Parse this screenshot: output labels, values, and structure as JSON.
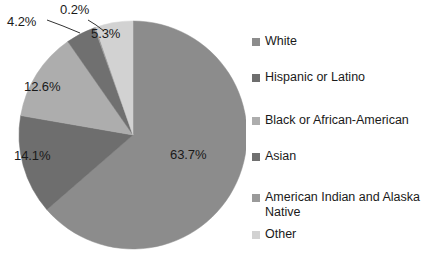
{
  "chart_data": {
    "type": "pie",
    "title": "",
    "subtitle": "",
    "xlabel": "",
    "ylabel": "",
    "legend_position": "right",
    "grid": false,
    "start_angle_deg": 0,
    "direction": "clockwise",
    "categories": [
      "White",
      "Hispanic or Latino",
      "Black or African-American",
      "Asian",
      "American Indian and Alaska Native",
      "Other"
    ],
    "values": [
      63.7,
      14.1,
      12.6,
      4.2,
      0.2,
      5.3
    ],
    "value_labels": [
      "63.7%",
      "14.1%",
      "12.6%",
      "4.2%",
      "0.2%",
      "5.3%"
    ],
    "colors": [
      "#8c8c8c",
      "#6e6e6e",
      "#adadad",
      "#707070",
      "#9a9a9a",
      "#d2d2d2"
    ],
    "units": "percent"
  },
  "pie": {
    "center_x": 133,
    "center_y": 135,
    "radius": 114,
    "slices": [
      {
        "name": "White",
        "value": 63.7,
        "label": "63.7%",
        "color": "#8c8c8c",
        "label_x": 170,
        "label_y": 147,
        "label_inside": true
      },
      {
        "name": "Hispanic or Latino",
        "value": 14.1,
        "label": "14.1%",
        "color": "#6e6e6e",
        "label_x": 14,
        "label_y": 148,
        "label_inside": true
      },
      {
        "name": "Black or African-American",
        "value": 12.6,
        "label": "12.6%",
        "color": "#adadad",
        "label_x": 24,
        "label_y": 79,
        "label_inside": true
      },
      {
        "name": "Asian",
        "value": 4.2,
        "label": "4.2%",
        "color": "#707070",
        "label_x": 7,
        "label_y": 14,
        "label_inside": false
      },
      {
        "name": "American Indian and Alaska Native",
        "value": 0.2,
        "label": "0.2%",
        "color": "#9a9a9a",
        "label_x": 60,
        "label_y": 2,
        "label_inside": false
      },
      {
        "name": "Other",
        "value": 5.3,
        "label": "5.3%",
        "color": "#d2d2d2",
        "label_x": 91,
        "label_y": 26,
        "label_inside": true
      }
    ]
  },
  "legend": {
    "items": [
      {
        "label": "White",
        "color": "#8c8c8c",
        "y": 34
      },
      {
        "label": "Hispanic or Latino",
        "color": "#6e6e6e",
        "y": 70
      },
      {
        "label": "Black or African-American",
        "color": "#adadad",
        "y": 113
      },
      {
        "label": "Asian",
        "color": "#707070",
        "y": 149
      },
      {
        "label": "American Indian and Alaska Native",
        "color": "#9a9a9a",
        "y": 190
      },
      {
        "label": "Other",
        "color": "#d2d2d2",
        "y": 227
      }
    ]
  }
}
